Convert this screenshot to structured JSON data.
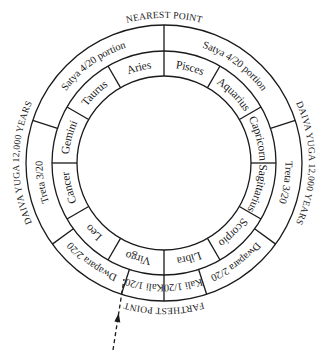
{
  "diagram": {
    "geometry": {
      "cx": 164,
      "cy": 163,
      "r_outer": 138,
      "r_mid": 112,
      "r_inner": 87
    },
    "colors": {
      "stroke": "#1a1a1a",
      "background": "#ffffff"
    },
    "outside_labels": [
      {
        "id": "nearest",
        "text": "NEAREST POINT",
        "angle": 0
      },
      {
        "id": "daiva-right",
        "text": "DAIVA YUGA 12,000 YEARS",
        "angle": 90
      },
      {
        "id": "farthest",
        "text": "FARTHEST POINT",
        "angle": 180
      },
      {
        "id": "daiva-left",
        "text": "DAIVA YUGA 12,000 YEARS",
        "angle": 270
      }
    ],
    "yuga_ring": {
      "dividers": [
        0,
        72,
        126,
        162,
        180,
        198,
        234,
        288
      ],
      "segments": [
        {
          "text": "Satya 4/20 portion",
          "angle": 36
        },
        {
          "text": "Treta 3/20",
          "angle": 99
        },
        {
          "text": "Dwapara 2/20",
          "angle": 144
        },
        {
          "text": "Kali 1/20",
          "angle": 171
        },
        {
          "text": "Kali 1/20",
          "angle": 189
        },
        {
          "text": "Dwapara 2/20",
          "angle": 216
        },
        {
          "text": "Treta 3/20",
          "angle": 261
        },
        {
          "text": "Satya 4/20 portion",
          "angle": 324
        }
      ]
    },
    "zodiac_ring": {
      "dividers": [
        0,
        30,
        60,
        90,
        120,
        150,
        180,
        210,
        240,
        270,
        300,
        330
      ],
      "signs": [
        {
          "text": "Pisces",
          "angle": 15
        },
        {
          "text": "Aquarius",
          "angle": 45
        },
        {
          "text": "Capricorn",
          "angle": 75
        },
        {
          "text": "Sagittarius",
          "angle": 105
        },
        {
          "text": "Scorpio",
          "angle": 135
        },
        {
          "text": "Libra",
          "angle": 165
        },
        {
          "text": "Virgo",
          "angle": 195
        },
        {
          "text": "Leo",
          "angle": 225
        },
        {
          "text": "Cancer",
          "angle": 255
        },
        {
          "text": "Gemini",
          "angle": 285
        },
        {
          "text": "Taurus",
          "angle": 315
        },
        {
          "text": "Aries",
          "angle": 345
        }
      ]
    },
    "pointer": {
      "label": "dashed-arrow",
      "angle": 198,
      "from": [
        113,
        350
      ],
      "to": [
        124,
        279
      ]
    }
  }
}
